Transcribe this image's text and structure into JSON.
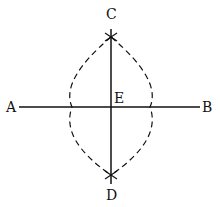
{
  "diagram": {
    "points": {
      "A": {
        "label": "A",
        "x": 11,
        "y": 112
      },
      "B": {
        "label": "B",
        "x": 208,
        "y": 112
      },
      "C": {
        "label": "C",
        "x": 111,
        "y": 19
      },
      "D": {
        "label": "D",
        "x": 111,
        "y": 200
      },
      "E": {
        "label": "E",
        "x": 119,
        "y": 103
      }
    },
    "segments": [
      {
        "name": "AB",
        "x1": 19,
        "y1": 107,
        "x2": 200,
        "y2": 107
      },
      {
        "name": "CD",
        "x1": 111,
        "y1": 29,
        "x2": 111,
        "y2": 184
      }
    ],
    "arcs": {
      "style": "dashed",
      "intersections": [
        {
          "x": 111,
          "y": 37
        },
        {
          "x": 111,
          "y": 175
        }
      ]
    },
    "colors": {
      "stroke": "#111111",
      "background": "#ffffff"
    }
  }
}
